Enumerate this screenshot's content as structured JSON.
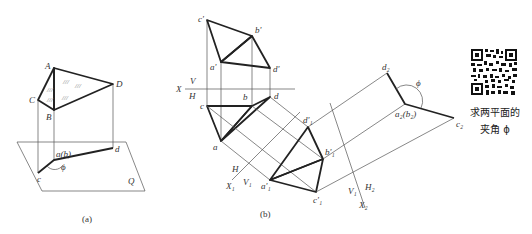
{
  "figure_a": {
    "caption": "(a)",
    "space_points": {
      "A": "A",
      "B": "B",
      "C": "C",
      "D": "D"
    },
    "plane_label": "Q",
    "projection_labels": {
      "ab": "a(b)",
      "c": "c",
      "d": "d"
    },
    "angle_label": "ϕ"
  },
  "figure_b": {
    "caption": "(b)",
    "axis_X": {
      "X": "X",
      "V": "V",
      "H": "H"
    },
    "front_view": {
      "c": "c'",
      "b": "b'",
      "a": "a'",
      "d": "d'"
    },
    "top_view": {
      "c": "c",
      "b": "b",
      "d": "d",
      "a": "a"
    },
    "axis_X1": {
      "X": "X₁",
      "H": "H",
      "V": "V₁"
    },
    "aux_view_1": {
      "d": "d'₁",
      "b": "b'₁",
      "a": "a'₁",
      "c": "c'₁"
    },
    "axis_X2": {
      "X": "X₂",
      "V": "V₁",
      "H": "H₂"
    },
    "aux_view_2": {
      "d": "d₂",
      "ab": "a₂(b₂)",
      "c": "c₂"
    },
    "angle_label": "ϕ"
  },
  "qr_panel": {
    "caption_line1": "求两平面的",
    "caption_line2": "夹角 ϕ"
  }
}
